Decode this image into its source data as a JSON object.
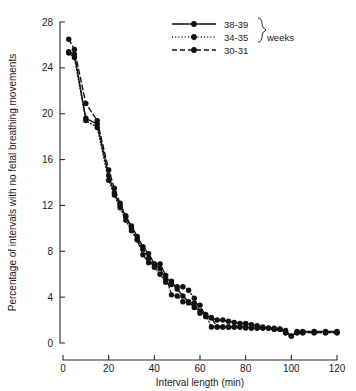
{
  "chart_data": {
    "type": "line",
    "title": "",
    "xlabel": "Interval length (min)",
    "ylabel": "Percentage of intervals with no fetal breathing movements",
    "xlim": [
      0,
      120
    ],
    "ylim": [
      0,
      28
    ],
    "xticks": [
      0,
      20,
      40,
      60,
      80,
      100,
      120
    ],
    "yticks": [
      0,
      4,
      8,
      12,
      16,
      20,
      24,
      28
    ],
    "grid": false,
    "legend_position": "top-right",
    "legend_group_label": "weeks",
    "series": [
      {
        "name": "38-39",
        "style": "solid",
        "marker": "filled-circle",
        "x": [
          2.5,
          5,
          10,
          15,
          20,
          22.5,
          25,
          27.5,
          30,
          32.5,
          35,
          37.5,
          40,
          42.5,
          45,
          47.5,
          50,
          52.5,
          55,
          57.5,
          60,
          62.5,
          65,
          67.5,
          70,
          72.5,
          75,
          77.5,
          80,
          82.5,
          85,
          87.5,
          90,
          92.5,
          95,
          97.5,
          100,
          102.5,
          105,
          110,
          115,
          120
        ],
        "y": [
          25.4,
          25.2,
          19.6,
          19.1,
          14.6,
          13.1,
          12.0,
          11.0,
          10.2,
          9.3,
          8.4,
          7.8,
          6.9,
          6.5,
          5.6,
          5.4,
          4.7,
          4.1,
          3.6,
          3.1,
          2.8,
          2.4,
          2.2,
          2.0,
          2.0,
          1.9,
          1.8,
          1.7,
          1.7,
          1.6,
          1.5,
          1.4,
          1.3,
          1.3,
          1.2,
          1.1,
          0.6,
          1.0,
          1.0,
          1.0,
          1.0,
          1.0
        ]
      },
      {
        "name": "34-35",
        "style": "dotted",
        "marker": "filled-circle",
        "x": [
          2.5,
          5,
          10,
          15,
          20,
          22.5,
          25,
          27.5,
          30,
          32.5,
          35,
          37.5,
          40,
          42.5,
          45,
          47.5,
          50,
          52.5,
          55,
          57.5,
          60,
          62.5,
          65,
          67.5,
          70,
          72.5,
          75,
          77.5,
          80,
          82.5,
          85,
          87.5,
          90,
          92.5,
          95,
          97.5,
          100,
          102.5,
          105,
          110,
          115,
          120
        ],
        "y": [
          25.3,
          24.9,
          19.4,
          18.8,
          14.2,
          12.9,
          11.8,
          10.7,
          9.8,
          9.0,
          8.2,
          7.4,
          6.6,
          6.0,
          5.3,
          5.1,
          4.9,
          4.9,
          4.6,
          3.9,
          2.6,
          2.5,
          1.4,
          1.4,
          1.4,
          1.4,
          1.4,
          1.4,
          1.3,
          1.3,
          1.3,
          1.3,
          1.3,
          1.2,
          1.2,
          0.9,
          0.6,
          0.9,
          0.9,
          0.9,
          0.9,
          0.9
        ]
      },
      {
        "name": "30-31",
        "style": "dashed",
        "marker": "filled-circle",
        "x": [
          2.5,
          5,
          10,
          15,
          20,
          22.5,
          25,
          27.5,
          30,
          32.5,
          35,
          37.5,
          40,
          42.5,
          45,
          47.5,
          50,
          52.5,
          55,
          57.5,
          60,
          62.5,
          65,
          67.5,
          70,
          72.5,
          75,
          77.5,
          80,
          82.5,
          85,
          87.5,
          90,
          92.5,
          95,
          97.5,
          100,
          102.5,
          105,
          110,
          115,
          120
        ],
        "y": [
          26.5,
          25.6,
          20.9,
          19.4,
          15.1,
          13.5,
          12.2,
          11.1,
          10.0,
          9.0,
          7.7,
          7.0,
          6.9,
          6.9,
          5.9,
          4.2,
          4.1,
          3.6,
          3.5,
          3.5,
          3.3,
          2.3,
          2.2,
          1.4,
          1.4,
          1.4,
          1.4,
          1.4,
          1.4,
          1.3,
          1.3,
          1.3,
          1.3,
          1.2,
          1.2,
          0.9,
          0.6,
          0.9,
          0.9,
          0.9,
          0.9,
          0.9
        ]
      }
    ]
  },
  "axis": {
    "x_title": "Interval length (min)",
    "y_title": "Percentage of intervals with no fetal breathing movements",
    "x_tick_labels": [
      "0",
      "20",
      "40",
      "60",
      "80",
      "100",
      "120"
    ],
    "y_tick_labels": [
      "0",
      "4",
      "8",
      "12",
      "16",
      "20",
      "24",
      "28"
    ]
  },
  "legend": {
    "items": [
      {
        "label": "38-39",
        "style": "solid"
      },
      {
        "label": "34-35",
        "style": "dotted"
      },
      {
        "label": "30-31",
        "style": "dashed"
      }
    ],
    "group_label": "weeks"
  },
  "colors": {
    "ink": "#111111",
    "axis": "#2b2b2b",
    "background": "#ffffff"
  }
}
